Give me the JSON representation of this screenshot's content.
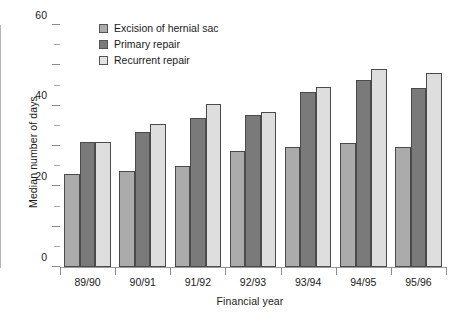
{
  "chart_data": {
    "type": "bar",
    "title": "",
    "xlabel": "Financial year",
    "ylabel": "Median number of days",
    "categories": [
      "89/90",
      "90/91",
      "91/92",
      "92/93",
      "93/94",
      "94/95",
      "95/96"
    ],
    "series": [
      {
        "name": "Excision of hernial sac",
        "color": "#ababab",
        "values": [
          46,
          47.5,
          50,
          57.5,
          59.5,
          61.5,
          59.5
        ]
      },
      {
        "name": "Primary repair",
        "color": "#7a7a7a",
        "values": [
          62,
          67,
          74,
          75.5,
          87,
          92.5,
          89
        ]
      },
      {
        "name": "Recurrent repair",
        "color": "#dedede",
        "values": [
          62,
          71,
          81,
          77,
          89.5,
          98,
          96
        ]
      }
    ],
    "ylim": [
      0,
      120
    ],
    "yticks": [
      0,
      20,
      40,
      60,
      80,
      100,
      120
    ],
    "yticklabels": [
      "0",
      "20",
      "40",
      "60",
      "80",
      "100",
      "120"
    ],
    "yminorticks": [
      10,
      30,
      50,
      70,
      90,
      110
    ],
    "grid": false,
    "legend_position": "upper-left-inside",
    "bar_edge_color": "#4a4a4a",
    "axis_color": "#8c8c8c",
    "background": "#ffffff"
  }
}
